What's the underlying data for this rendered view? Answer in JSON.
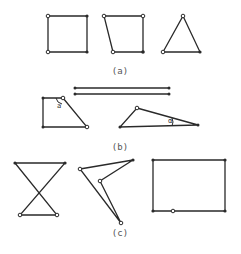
{
  "figure": {
    "panels": [
      {
        "label": "(a)",
        "label_pos": [
          120,
          74
        ]
      },
      {
        "label": "(b)",
        "label_pos": [
          120,
          150
        ]
      },
      {
        "label": "(c)",
        "label_pos": [
          120,
          236
        ]
      }
    ],
    "angle_labels": [
      {
        "text": "a",
        "pos": [
          57,
          108
        ]
      },
      {
        "text": "α",
        "pos": [
          168,
          123
        ]
      }
    ],
    "colors": {
      "stroke": "#2a2a2a",
      "label": "#555555"
    }
  }
}
